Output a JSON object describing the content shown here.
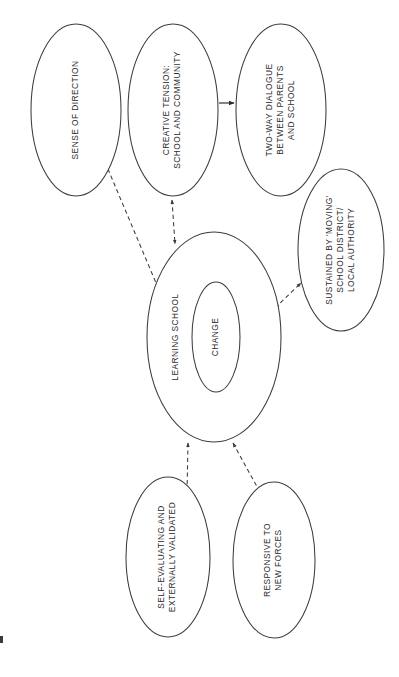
{
  "diagram": {
    "orientation": "rotated-90-counterclockwise",
    "background_color": "#ffffff",
    "stroke_color": "#3d3d3d",
    "text_color": "#2b2b2b",
    "nodes": [
      {
        "id": "sense-of-direction",
        "name": "sense-of-direction-node",
        "shape": "ellipse",
        "lines": [
          "SENSE OF DIRECTION"
        ],
        "cx": 76,
        "cy": 110,
        "rx": 45,
        "ry": 86
      },
      {
        "id": "creative-tension",
        "name": "creative-tension-node",
        "shape": "ellipse",
        "lines": [
          "CREATIVE TENSION:",
          "SCHOOL AND COMMUNITY"
        ],
        "cx": 173,
        "cy": 110,
        "rx": 45,
        "ry": 86
      },
      {
        "id": "two-way-dialogue",
        "name": "two-way-dialogue-node",
        "shape": "ellipse",
        "lines": [
          "TWO-WAY DIALOGUE",
          "BETWEEN PARENTS",
          "AND SCHOOL"
        ],
        "cx": 281,
        "cy": 110,
        "rx": 45,
        "ry": 86
      },
      {
        "id": "sustained-by-moving",
        "name": "sustained-by-moving-node",
        "shape": "ellipse",
        "lines": [
          "SUSTAINED BY 'MOVING'",
          "SCHOOL DISTRICT/",
          "LOCAL AUTHORITY"
        ],
        "cx": 341,
        "cy": 250,
        "rx": 43,
        "ry": 81
      },
      {
        "id": "learning-school",
        "name": "learning-school-node",
        "shape": "ellipse",
        "lines": [
          "LEARNING SCHOOL"
        ],
        "cx": 214,
        "cy": 337,
        "rx": 67,
        "ry": 105
      },
      {
        "id": "change",
        "name": "change-node",
        "shape": "ellipse",
        "lines": [
          "CHANGE"
        ],
        "cx": 216,
        "cy": 337,
        "rx": 24,
        "ry": 55
      },
      {
        "id": "self-evaluating",
        "name": "self-evaluating-node",
        "shape": "ellipse",
        "lines": [
          "SELF-EVALUATING AND",
          "EXTERNALLY VALIDATED"
        ],
        "cx": 168,
        "cy": 557,
        "rx": 42,
        "ry": 80
      },
      {
        "id": "responsive-new-forces",
        "name": "responsive-new-forces-node",
        "shape": "ellipse",
        "lines": [
          "RESPONSIVE TO",
          "NEW FORCES"
        ],
        "cx": 274,
        "cy": 560,
        "rx": 41,
        "ry": 78
      }
    ],
    "edges": [
      {
        "id": "edge-creative-tension-to-dialogue",
        "name": "edge-creative-tension-to-two-way-dialogue",
        "style": "solid",
        "arrows": "single",
        "from": "creative-tension",
        "to": "two-way-dialogue"
      },
      {
        "id": "edge-sense-of-direction-to-learning-school",
        "name": "edge-sense-of-direction-to-learning-school",
        "style": "dashed",
        "arrows": "double",
        "from": "sense-of-direction",
        "to": "learning-school"
      },
      {
        "id": "edge-creative-tension-to-learning-school",
        "name": "edge-creative-tension-to-learning-school",
        "style": "dashed",
        "arrows": "double",
        "from": "creative-tension",
        "to": "learning-school"
      },
      {
        "id": "edge-sustained-to-learning-school",
        "name": "edge-sustained-by-moving-to-learning-school",
        "style": "dashed",
        "arrows": "double",
        "from": "sustained-by-moving",
        "to": "learning-school"
      },
      {
        "id": "edge-self-evaluating-to-learning-school",
        "name": "edge-self-evaluating-to-learning-school",
        "style": "dashed",
        "arrows": "double",
        "from": "self-evaluating",
        "to": "learning-school"
      },
      {
        "id": "edge-responsive-to-learning-school",
        "name": "edge-responsive-new-forces-to-learning-school",
        "style": "dashed",
        "arrows": "double",
        "from": "responsive-new-forces",
        "to": "learning-school"
      }
    ]
  }
}
